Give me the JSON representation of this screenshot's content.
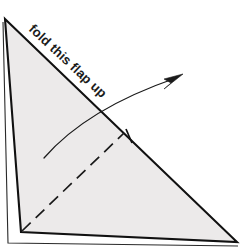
{
  "diagram": {
    "title": "fold this flap up",
    "type": "origami-fold-instruction",
    "annotation": {
      "label": "fold this flap up",
      "rotation_degrees": 43,
      "anchor_x": 28,
      "anchor_y": 30
    },
    "colors": {
      "background": "#ffffff",
      "paper_fill": "#eceaea",
      "edge_stroke": "#111111",
      "fold_stroke": "#1a1a1a",
      "arrow_stroke": "#1a1a1a",
      "text": "#1b1b1b"
    },
    "shapes": {
      "paper_triangle": {
        "name": "triangular-paper-face",
        "points": "5,19 237,242 21,232",
        "description": "large right triangle of folded paper"
      },
      "back_layer_left_edge": {
        "name": "back-layer-left-edge",
        "points": "3,22 8,243"
      },
      "back_layer_bottom_edge": {
        "name": "back-layer-bottom-edge",
        "points": "8,243 238,246"
      },
      "fold_crease": {
        "name": "fold-crease-dashed-line",
        "points": "22,231 124,133",
        "style": "dashed"
      },
      "crease_tick": {
        "name": "crease-end-tick-mark",
        "points": "126,129 132,143"
      },
      "motion_arrow": {
        "name": "fold-direction-arrow",
        "path": "M 44,158 C 70,128 112,100 176,78",
        "head_points": "183,74 166,80 172,83 165,88"
      }
    }
  }
}
